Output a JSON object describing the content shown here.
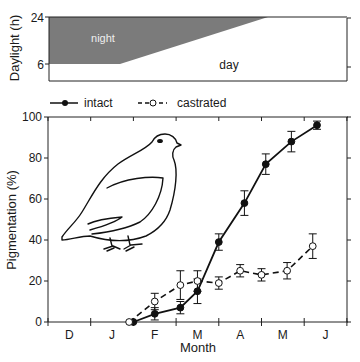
{
  "top_panel": {
    "ylabel": "Daylight (h)",
    "yticks": [
      "24",
      "6"
    ],
    "night_label": "night",
    "day_label": "day",
    "night_color": "#7b7b7b"
  },
  "legend": {
    "items": [
      {
        "label": "intact",
        "style": "solid-filled"
      },
      {
        "label": "castrated",
        "style": "dashed-open"
      }
    ]
  },
  "chart_data": [
    {
      "type": "area",
      "title": "",
      "ylabel": "Daylight (h)",
      "yticks": [
        24,
        6
      ],
      "regions": [
        {
          "name": "night",
          "description": "night length decreasing from ~18h (Dec–Jan) to 0 by late April"
        },
        {
          "name": "day",
          "description": "daylight increasing from ~6h to 24h"
        }
      ],
      "daylight_hours": {
        "x": [
          "D",
          "J",
          "early F",
          "A",
          "late A",
          "M",
          "J"
        ],
        "values": [
          6,
          6,
          6,
          18,
          24,
          24,
          24
        ]
      }
    },
    {
      "type": "line",
      "title": "",
      "xlabel": "Month",
      "ylabel": "Pigmentation (%)",
      "categories": [
        "D",
        "J",
        "F",
        "M",
        "A",
        "M",
        "J"
      ],
      "ylim": [
        0,
        100
      ],
      "yticks": [
        0,
        20,
        40,
        60,
        80,
        100
      ],
      "grid": false,
      "legend_position": "top",
      "series": [
        {
          "name": "intact",
          "marker": "filled-circle",
          "line": "solid",
          "x_month": [
            2.0,
            2.5,
            3.1,
            3.5,
            4.0,
            4.6,
            5.1,
            5.7,
            6.3
          ],
          "values": [
            0,
            4,
            7,
            15,
            39,
            58,
            77,
            88,
            96
          ],
          "error": [
            0,
            3,
            3,
            6,
            4,
            6,
            5,
            5,
            2
          ]
        },
        {
          "name": "castrated",
          "marker": "open-circle",
          "line": "dashed",
          "x_month": [
            1.9,
            2.5,
            3.1,
            3.5,
            4.0,
            4.5,
            5.0,
            5.6,
            6.2
          ],
          "values": [
            0,
            10,
            18,
            20,
            19,
            25,
            23,
            25,
            37
          ],
          "error": [
            0,
            4,
            7,
            5,
            3,
            3,
            3,
            4,
            6
          ]
        }
      ]
    }
  ],
  "axes": {
    "ylabel": "Pigmentation (%)",
    "xlabel": "Month",
    "yticks": [
      "0",
      "20",
      "40",
      "60",
      "80",
      "100"
    ],
    "months": [
      "D",
      "J",
      "F",
      "M",
      "A",
      "M",
      "J"
    ]
  },
  "illustration": {
    "subject": "ptarmigan-bird"
  }
}
